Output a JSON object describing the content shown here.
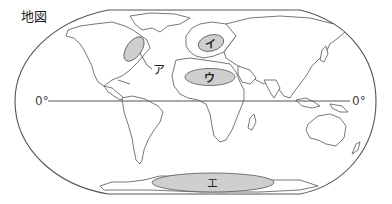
{
  "title": "地図",
  "equator": {
    "label_left": "0°",
    "label_right": "0°"
  },
  "regions": [
    {
      "id": "a",
      "label": "ア",
      "description": "eastern North America"
    },
    {
      "id": "i",
      "label": "イ",
      "description": "Europe"
    },
    {
      "id": "u",
      "label": "ウ",
      "description": "northern Africa"
    },
    {
      "id": "e",
      "label": "エ",
      "description": "Antarctica"
    }
  ],
  "colors": {
    "region_fill": "#cfcfcf",
    "outline": "#555555",
    "background": "#ffffff"
  }
}
